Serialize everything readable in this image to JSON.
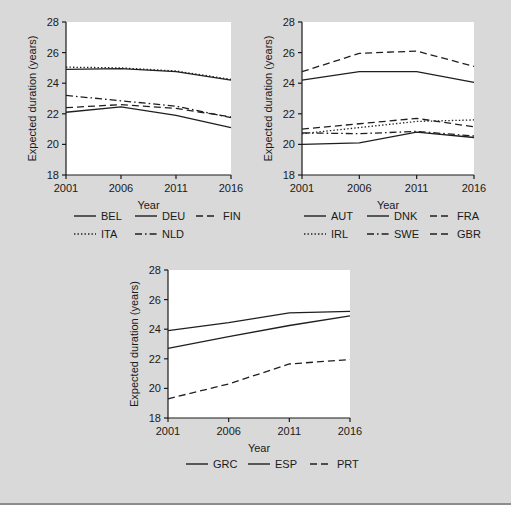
{
  "figure": {
    "background_color": "#d9d9d9",
    "plot_background_color": "#ffffff",
    "line_color": "#1f1f1f"
  },
  "chart_data": [
    {
      "type": "line",
      "panel_id": "panel-1",
      "title": "",
      "xlabel": "Year",
      "ylabel": "Expected duration (years)",
      "x": [
        2001,
        2006,
        2011,
        2016
      ],
      "xticks": [
        "2001",
        "2006",
        "2011",
        "2016"
      ],
      "yticks": [
        "18",
        "20",
        "22",
        "24",
        "26",
        "28"
      ],
      "xlim": [
        2001,
        2016
      ],
      "ylim": [
        18,
        28
      ],
      "grid": false,
      "legend_position": "below",
      "series": [
        {
          "name": "BEL",
          "dash": "solid",
          "values": [
            22.1,
            22.45,
            21.9,
            21.1
          ]
        },
        {
          "name": "DEU",
          "dash": "solid",
          "values": [
            24.9,
            24.95,
            24.75,
            24.2
          ]
        },
        {
          "name": "FIN",
          "dash": "dashed",
          "values": [
            22.4,
            22.6,
            22.35,
            21.8
          ]
        },
        {
          "name": "ITA",
          "dash": "dotted",
          "values": [
            25.05,
            25.0,
            24.8,
            24.25
          ]
        },
        {
          "name": "NLD",
          "dash": "dashdot",
          "values": [
            23.2,
            22.85,
            22.5,
            21.75
          ]
        }
      ]
    },
    {
      "type": "line",
      "panel_id": "panel-2",
      "title": "",
      "xlabel": "Year",
      "ylabel": "Expected duration (years)",
      "x": [
        2001,
        2006,
        2011,
        2016
      ],
      "xticks": [
        "2001",
        "2006",
        "2011",
        "2016"
      ],
      "yticks": [
        "18",
        "20",
        "22",
        "24",
        "26",
        "28"
      ],
      "xlim": [
        2001,
        2016
      ],
      "ylim": [
        18,
        28
      ],
      "grid": false,
      "legend_position": "below",
      "series": [
        {
          "name": "AUT",
          "dash": "solid",
          "values": [
            24.2,
            24.75,
            24.75,
            24.05
          ]
        },
        {
          "name": "DNK",
          "dash": "solid",
          "values": [
            20.0,
            20.1,
            20.8,
            20.45
          ]
        },
        {
          "name": "FRA",
          "dash": "dashed",
          "values": [
            24.75,
            25.95,
            26.1,
            25.1
          ]
        },
        {
          "name": "IRL",
          "dash": "dotted",
          "values": [
            20.7,
            21.1,
            21.5,
            21.6
          ]
        },
        {
          "name": "SWE",
          "dash": "dashdot",
          "values": [
            20.75,
            20.7,
            20.85,
            20.55
          ]
        },
        {
          "name": "GBR",
          "dash": "dashed",
          "values": [
            21.0,
            21.35,
            21.7,
            21.15
          ]
        }
      ]
    },
    {
      "type": "line",
      "panel_id": "panel-3",
      "title": "",
      "xlabel": "Year",
      "ylabel": "Expected duration (years)",
      "x": [
        2001,
        2006,
        2011,
        2016
      ],
      "xticks": [
        "2001",
        "2006",
        "2011",
        "2016"
      ],
      "yticks": [
        "18",
        "20",
        "22",
        "24",
        "26",
        "28"
      ],
      "xlim": [
        2001,
        2016
      ],
      "ylim": [
        18,
        28
      ],
      "grid": false,
      "legend_position": "below",
      "series": [
        {
          "name": "GRC",
          "dash": "solid",
          "values": [
            22.7,
            23.5,
            24.25,
            24.9
          ]
        },
        {
          "name": "ESP",
          "dash": "solid",
          "values": [
            23.9,
            24.45,
            25.1,
            25.2
          ]
        },
        {
          "name": "PRT",
          "dash": "dashed",
          "values": [
            19.3,
            20.3,
            21.65,
            21.95
          ]
        }
      ]
    }
  ]
}
